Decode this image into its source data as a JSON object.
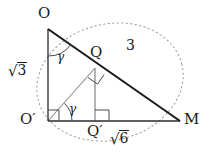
{
  "figure": {
    "type": "geometry-diagram",
    "background_color": "#ffffff",
    "stroke_color": "#1a1a1a",
    "light_stroke_color": "#8c8c8c",
    "dotted_color": "#9a9a9a"
  },
  "vertices": {
    "O": {
      "label": "O",
      "x": 48,
      "y": 29
    },
    "O_prime": {
      "label": "O",
      "prime": "′",
      "x": 48,
      "y": 121
    },
    "M": {
      "label": "M",
      "x": 180,
      "y": 121
    },
    "Q": {
      "label": "Q",
      "x": 95,
      "y": 68
    },
    "Q_prime": {
      "label": "Q",
      "prime": "′",
      "x": 95,
      "y": 121
    }
  },
  "labels": {
    "vertex_O": "O",
    "vertex_O_prime": "O′",
    "vertex_M": "M",
    "vertex_Q": "Q",
    "vertex_Q_prime": "Q′",
    "side_left": {
      "radical": "√",
      "radicand": "3",
      "text": "√3"
    },
    "side_hypotenuse": "3",
    "side_base": {
      "radical": "√",
      "radicand": "6",
      "text": "√6"
    },
    "angle_top": "γ",
    "angle_bottom": "γ"
  },
  "segments": [
    {
      "name": "leg-O-to-Oprime",
      "from": "O",
      "to": "O_prime",
      "style": "solid",
      "weight": "thin",
      "length_label": "√3"
    },
    {
      "name": "hypotenuse-O-to-M",
      "from": "O",
      "to": "M",
      "style": "solid",
      "weight": "thick",
      "length_label": "3"
    },
    {
      "name": "base-Oprime-to-M",
      "from": "O_prime",
      "to": "M",
      "style": "solid",
      "weight": "thin",
      "length_label": "√6"
    },
    {
      "name": "altitude-Oprime-to-Q",
      "from": "O_prime",
      "to": "Q",
      "style": "solid",
      "weight": "light"
    },
    {
      "name": "vertical-Q-to-Qprime",
      "from": "Q",
      "to": "Q_prime",
      "style": "solid",
      "weight": "light"
    }
  ],
  "right_angles": [
    {
      "name": "right-angle-at-Oprime",
      "at": "O_prime",
      "between": [
        "leg-O-to-Oprime",
        "base-Oprime-to-M"
      ]
    },
    {
      "name": "right-angle-at-Q",
      "at": "Q",
      "between": [
        "altitude-Oprime-to-Q",
        "hypotenuse-O-to-M"
      ]
    },
    {
      "name": "right-angle-at-Qprime",
      "at": "Q_prime",
      "between": [
        "vertical-Q-to-Qprime",
        "base-Oprime-to-M"
      ]
    }
  ],
  "marked_angles": [
    {
      "name": "gamma-at-O",
      "at": "O",
      "symbol": "γ",
      "arc": true
    },
    {
      "name": "gamma-at-Oprime",
      "at": "O_prime",
      "symbol": "γ",
      "arc": true
    }
  ],
  "ellipse": {
    "name": "circumscribing-dotted-ellipse",
    "style": "dotted",
    "cx": 110,
    "cy": 82,
    "rx": 74,
    "ry": 58,
    "rotation_deg": -14
  }
}
